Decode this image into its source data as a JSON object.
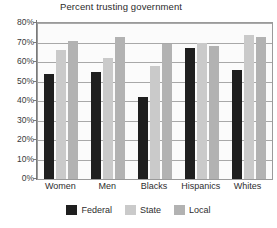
{
  "chart_data": {
    "type": "bar",
    "title": "Percent trusting government",
    "xlabel": "",
    "ylabel": "",
    "categories": [
      "Women",
      "Men",
      "Blacks",
      "Hispanics",
      "Whites"
    ],
    "series": [
      {
        "name": "Federal",
        "color": "#1f1f1f",
        "values": [
          54,
          55,
          42,
          67,
          56
        ]
      },
      {
        "name": "State",
        "color": "#cacaca",
        "values": [
          66,
          62,
          58,
          70,
          74
        ]
      },
      {
        "name": "Local",
        "color": "#b2b2b2",
        "values": [
          71,
          73,
          69,
          68,
          73
        ]
      }
    ],
    "ylim": [
      0,
      80
    ],
    "ytick_values": [
      0,
      10,
      20,
      30,
      40,
      50,
      60,
      70,
      80
    ],
    "ytick_labels": [
      "0%",
      "10%",
      "20%",
      "30%",
      "40%",
      "50%",
      "60%",
      "70%",
      "80%"
    ],
    "grid": true,
    "legend_position": "bottom",
    "legend_entries": [
      "Federal",
      "State",
      "Local"
    ]
  }
}
